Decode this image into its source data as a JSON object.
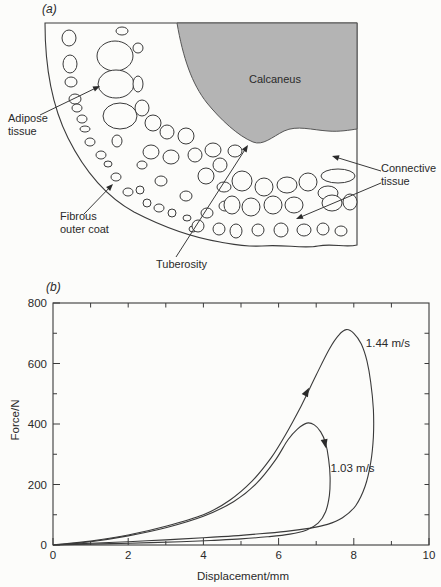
{
  "figure": {
    "panel_a": {
      "tag": "(a)",
      "labels": {
        "calcaneus": "Calcaneus",
        "adipose": "Adipose\ntissue",
        "fibrous": "Fibrous\nouter coat",
        "tuberosity": "Tuberosity",
        "connective": "Connective\ntissue"
      },
      "cells": [
        [
          122,
          31,
          6,
          4
        ],
        [
          115,
          56,
          18,
          15
        ],
        [
          138,
          48,
          5,
          5
        ],
        [
          116,
          84,
          18,
          14
        ],
        [
          138,
          84,
          5,
          8
        ],
        [
          69,
          38,
          7,
          8
        ],
        [
          70,
          64,
          7,
          9
        ],
        [
          71,
          82,
          6,
          5
        ],
        [
          75,
          99,
          6,
          5
        ],
        [
          77,
          108,
          5,
          4
        ],
        [
          82,
          119,
          5,
          4
        ],
        [
          85,
          129,
          5,
          3
        ],
        [
          90,
          142,
          5,
          4
        ],
        [
          101,
          155,
          5,
          4
        ],
        [
          108,
          164,
          4,
          3
        ],
        [
          116,
          177,
          5,
          4
        ],
        [
          128,
          192,
          5,
          4
        ],
        [
          140,
          190,
          4,
          4
        ],
        [
          147,
          203,
          4,
          4
        ],
        [
          159,
          208,
          5,
          4
        ],
        [
          172,
          213,
          4,
          4
        ],
        [
          187,
          218,
          4,
          3
        ],
        [
          193,
          229,
          4,
          3
        ],
        [
          120,
          116,
          17,
          13
        ],
        [
          142,
          108,
          7,
          8
        ],
        [
          153,
          123,
          8,
          8
        ],
        [
          167,
          132,
          7,
          7
        ],
        [
          186,
          136,
          8,
          8
        ],
        [
          151,
          152,
          8,
          7
        ],
        [
          171,
          157,
          8,
          7
        ],
        [
          195,
          155,
          7,
          7
        ],
        [
          213,
          150,
          8,
          7
        ],
        [
          235,
          151,
          7,
          6
        ],
        [
          220,
          165,
          7,
          7
        ],
        [
          206,
          176,
          8,
          8
        ],
        [
          224,
          187,
          7,
          5
        ],
        [
          117,
          141,
          5,
          6
        ],
        [
          142,
          165,
          5,
          4
        ],
        [
          161,
          181,
          6,
          5
        ],
        [
          186,
          196,
          6,
          5
        ],
        [
          207,
          213,
          6,
          5
        ],
        [
          225,
          206,
          6,
          5
        ],
        [
          242,
          181,
          10,
          10
        ],
        [
          264,
          187,
          9,
          9
        ],
        [
          287,
          185,
          10,
          8
        ],
        [
          308,
          182,
          9,
          9
        ],
        [
          338,
          176,
          17,
          7
        ],
        [
          328,
          193,
          10,
          7
        ],
        [
          232,
          205,
          8,
          9
        ],
        [
          251,
          207,
          9,
          9
        ],
        [
          273,
          205,
          9,
          9
        ],
        [
          294,
          205,
          9,
          8
        ],
        [
          332,
          203,
          10,
          8
        ],
        [
          350,
          202,
          7,
          8
        ],
        [
          198,
          226,
          6,
          6
        ],
        [
          219,
          229,
          6,
          6
        ],
        [
          236,
          231,
          6,
          7
        ],
        [
          258,
          230,
          6,
          6
        ],
        [
          281,
          230,
          7,
          7
        ],
        [
          304,
          230,
          7,
          6
        ],
        [
          323,
          229,
          6,
          6
        ],
        [
          341,
          231,
          6,
          5
        ]
      ],
      "leaders": [
        [
          40,
          115,
          100,
          86
        ],
        [
          84,
          214,
          113,
          184
        ],
        [
          176,
          257,
          248,
          145
        ],
        [
          381,
          171,
          332,
          156
        ],
        [
          381,
          183,
          296,
          219
        ]
      ]
    },
    "panel_b": {
      "tag": "(b)"
    }
  },
  "chart_data": {
    "type": "line",
    "title": "",
    "xlabel": "Displacement/mm",
    "ylabel": "Force/N",
    "xlim": [
      0,
      10
    ],
    "ylim": [
      0,
      800
    ],
    "grid": false,
    "x_major_ticks": [
      0,
      2,
      4,
      6,
      8,
      10
    ],
    "x_minor_ticks": [
      1,
      3,
      5,
      7,
      9
    ],
    "x_top_ticks": [
      1,
      2,
      3,
      4,
      5,
      6,
      7,
      8,
      9
    ],
    "y_major_ticks": [
      0,
      200,
      400,
      600,
      800
    ],
    "y_minor_ticks": [
      100,
      300,
      500,
      700
    ],
    "y_right_ticks": [
      100,
      200,
      300,
      400,
      500,
      600,
      700
    ],
    "series": [
      {
        "name": "1.44 m/s",
        "label_at": {
          "x": 8.32,
          "y": 655
        },
        "points": [
          [
            0,
            0
          ],
          [
            1,
            13
          ],
          [
            2,
            33
          ],
          [
            3,
            62
          ],
          [
            4,
            100
          ],
          [
            4.7,
            148
          ],
          [
            5.3,
            212
          ],
          [
            5.8,
            288
          ],
          [
            6.2,
            368
          ],
          [
            6.6,
            460
          ],
          [
            7.0,
            562
          ],
          [
            7.35,
            648
          ],
          [
            7.6,
            694
          ],
          [
            7.8,
            712
          ],
          [
            8.0,
            700
          ],
          [
            8.2,
            664
          ],
          [
            8.35,
            608
          ],
          [
            8.45,
            538
          ],
          [
            8.52,
            448
          ],
          [
            8.52,
            358
          ],
          [
            8.45,
            272
          ],
          [
            8.3,
            194
          ],
          [
            8.05,
            130
          ],
          [
            7.7,
            90
          ],
          [
            7.3,
            68
          ],
          [
            6.8,
            55
          ],
          [
            6.2,
            45
          ],
          [
            5.5,
            37
          ],
          [
            4.8,
            30
          ],
          [
            4,
            24
          ],
          [
            3,
            17
          ],
          [
            2,
            11
          ],
          [
            1,
            6
          ],
          [
            0,
            0
          ]
        ]
      },
      {
        "name": "1.03 m/s",
        "label_at": {
          "x": 7.38,
          "y": 240
        },
        "points": [
          [
            0,
            0
          ],
          [
            1,
            11
          ],
          [
            2,
            30
          ],
          [
            3,
            57
          ],
          [
            4,
            95
          ],
          [
            4.8,
            143
          ],
          [
            5.4,
            202
          ],
          [
            5.9,
            278
          ],
          [
            6.25,
            348
          ],
          [
            6.5,
            383
          ],
          [
            6.75,
            403
          ],
          [
            6.95,
            397
          ],
          [
            7.12,
            374
          ],
          [
            7.25,
            337
          ],
          [
            7.33,
            284
          ],
          [
            7.37,
            223
          ],
          [
            7.35,
            164
          ],
          [
            7.25,
            110
          ],
          [
            7.05,
            72
          ],
          [
            6.75,
            50
          ],
          [
            6.3,
            36
          ],
          [
            5.7,
            27
          ],
          [
            5,
            20
          ],
          [
            4.2,
            15
          ],
          [
            3.4,
            11
          ],
          [
            2.6,
            8
          ],
          [
            1.8,
            5
          ],
          [
            1,
            3
          ],
          [
            0,
            0
          ]
        ]
      }
    ],
    "flow_arrows": [
      {
        "x": 6.81,
        "y": 520,
        "angle": -62
      },
      {
        "x": 7.26,
        "y": 320,
        "angle": 78
      }
    ]
  },
  "colors": {
    "line": "#3a3a3a",
    "calcaneus_fill": "#b4b4b4",
    "text": "#2a2a2a",
    "bg": "#fcfcfa"
  }
}
